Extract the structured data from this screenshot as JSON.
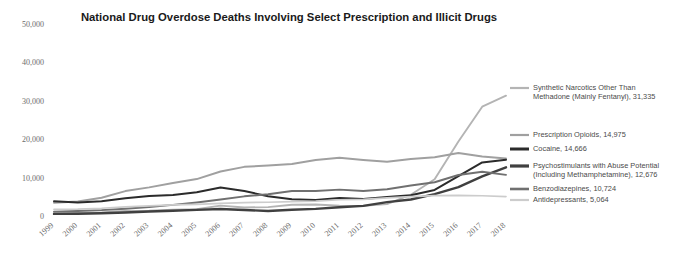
{
  "chart_data": {
    "type": "line",
    "title": "National Drug Overdose Deaths Involving Select Prescription and Illicit Drugs",
    "xlabel": "",
    "ylabel": "",
    "grid": false,
    "legend_position": "right",
    "ylim": [
      0,
      50000
    ],
    "yticks": [
      0,
      10000,
      20000,
      30000,
      40000,
      50000
    ],
    "ytick_labels": [
      "0",
      "10,000",
      "20,000",
      "30,000",
      "40,000",
      "50,000"
    ],
    "x": [
      1999,
      2000,
      2001,
      2002,
      2003,
      2004,
      2005,
      2006,
      2007,
      2008,
      2009,
      2010,
      2011,
      2012,
      2013,
      2014,
      2015,
      2016,
      2017,
      2018
    ],
    "categories": [
      "1999",
      "2000",
      "2001",
      "2002",
      "2003",
      "2004",
      "2005",
      "2006",
      "2007",
      "2008",
      "2009",
      "2010",
      "2011",
      "2012",
      "2013",
      "2014",
      "2015",
      "2016",
      "2017",
      "2018"
    ],
    "series": [
      {
        "name": "Synthetic Narcotics Other Than Methadone (Mainly Fentanyl)",
        "legend_label": "Synthetic Narcotics Other Than Methadone (Mainly Fentanyl), 31,335",
        "end_value": 31335,
        "color": "#b4b4b4",
        "width": 1.9,
        "values": [
          730,
          782,
          957,
          1295,
          1400,
          1664,
          1742,
          2707,
          2213,
          2306,
          2946,
          3007,
          2666,
          2628,
          3105,
          5544,
          9580,
          19413,
          28466,
          31335
        ]
      },
      {
        "name": "Prescription Opioids",
        "legend_label": "Prescription Opioids, 14,975",
        "end_value": 14975,
        "color": "#a0a0a0",
        "width": 2.0,
        "values": [
          3442,
          3785,
          4770,
          6483,
          7456,
          8577,
          9612,
          11589,
          12796,
          13149,
          13523,
          14583,
          15140,
          14583,
          14145,
          14838,
          15281,
          16412,
          15482,
          14975
        ]
      },
      {
        "name": "Cocaine",
        "legend_label": "Cocaine, 14,666",
        "end_value": 14666,
        "color": "#2b2b2b",
        "width": 2.0,
        "values": [
          3822,
          3544,
          3833,
          4599,
          5196,
          5443,
          6208,
          7448,
          6512,
          5129,
          4350,
          4183,
          4681,
          4404,
          4944,
          5415,
          6784,
          10375,
          13942,
          14666
        ]
      },
      {
        "name": "Psychostimulants with Abuse Potential (Including Methamphetamine)",
        "legend_label": "Psychostimulants with Abuse Potential (Including Methamphetamine), 12,676",
        "end_value": 12676,
        "color": "#404040",
        "width": 2.4,
        "values": [
          547,
          573,
          708,
          920,
          1178,
          1371,
          1608,
          1812,
          1562,
          1304,
          1632,
          1854,
          2266,
          2635,
          3627,
          4298,
          5716,
          7542,
          10333,
          12676
        ]
      },
      {
        "name": "Benzodiazepines",
        "legend_label": "Benzodiazepines, 10,724",
        "end_value": 10724,
        "color": "#707070",
        "width": 1.9,
        "values": [
          1135,
          1298,
          1530,
          1906,
          2348,
          2894,
          3526,
          4286,
          5125,
          5663,
          6497,
          6497,
          6872,
          6524,
          6973,
          7945,
          8791,
          10684,
          11537,
          10724
        ]
      },
      {
        "name": "Antidepressants",
        "legend_label": "Antidepressants, 5,064",
        "end_value": 5064,
        "color": "#cccccc",
        "width": 1.7,
        "values": [
          1749,
          1800,
          2021,
          2399,
          2643,
          2888,
          3033,
          3266,
          3499,
          3576,
          3720,
          3889,
          4226,
          4315,
          4699,
          5038,
          5306,
          5380,
          5269,
          5064
        ]
      }
    ]
  },
  "legend": {
    "entries": [
      {
        "key": "synthetic-narcotics",
        "lines": [
          "Synthetic Narcotics Other Than",
          "Methadone (Mainly Fentanyl), 31,335"
        ],
        "color": "#b4b4b4",
        "swatch_width": 2.2
      },
      {
        "key": "prescription-opioids",
        "lines": [
          "Prescription Opioids, 14,975"
        ],
        "color": "#a0a0a0",
        "swatch_width": 2.2
      },
      {
        "key": "cocaine",
        "lines": [
          "Cocaine, 14,666"
        ],
        "color": "#2b2b2b",
        "swatch_width": 3.0
      },
      {
        "key": "psychostimulants",
        "lines": [
          "Psychostimulants with Abuse Potential",
          "(Including Methamphetamine), 12,676"
        ],
        "color": "#404040",
        "swatch_width": 3.2
      },
      {
        "key": "benzodiazepines",
        "lines": [
          "Benzodiazepines, 10,724"
        ],
        "color": "#707070",
        "swatch_width": 2.6
      },
      {
        "key": "antidepressants",
        "lines": [
          "Antidepressants, 5,064"
        ],
        "color": "#cccccc",
        "swatch_width": 2.2
      }
    ]
  }
}
